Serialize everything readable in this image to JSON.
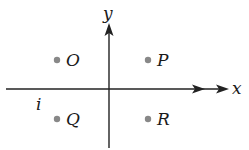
{
  "diagram": {
    "axes": {
      "x_label": "x",
      "y_label": "y",
      "extra_label": "i"
    },
    "points": [
      {
        "name": "O",
        "quadrant": "II"
      },
      {
        "name": "P",
        "quadrant": "I"
      },
      {
        "name": "Q",
        "quadrant": "III"
      },
      {
        "name": "R",
        "quadrant": "IV"
      }
    ],
    "colors": {
      "axis": "#222222",
      "point": "#888888",
      "text": "#1a1a1a"
    }
  }
}
